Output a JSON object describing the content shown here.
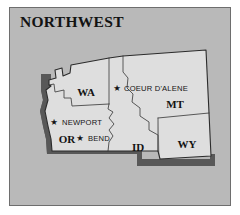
{
  "figure": {
    "title": "NORTHWEST",
    "background_color": "#ffffff",
    "panel_color": "#b9b9b9",
    "panel_border_color": "#6e6e6e",
    "land_fill_color": "#dedede",
    "land_outline_color": "#2b2b2b",
    "state_border_color": "#4a4a4a",
    "shadow_color": "#585858",
    "text_color": "#131313"
  },
  "map": {
    "region_name": "NORTHWEST",
    "states": [
      {
        "abbr": "WA",
        "name_label": "WA",
        "x": 76,
        "y": 84
      },
      {
        "abbr": "MT",
        "name_label": "MT",
        "x": 165,
        "y": 96
      },
      {
        "abbr": "OR",
        "name_label": "OR",
        "x": 57,
        "y": 131
      },
      {
        "abbr": "ID",
        "name_label": "ID",
        "x": 128,
        "y": 139
      },
      {
        "abbr": "WY",
        "name_label": "WY",
        "x": 177,
        "y": 136
      }
    ],
    "cities": [
      {
        "name": "COEUR D'ALENE",
        "state": "ID",
        "marker": "star",
        "star_x": 107,
        "star_y": 80,
        "label_x": 114,
        "label_y": 80
      },
      {
        "name": "NEWPORT",
        "state": "OR",
        "marker": "star",
        "star_x": 44,
        "star_y": 114,
        "label_x": 52,
        "label_y": 114
      },
      {
        "name": "BEND",
        "state": "OR",
        "marker": "star",
        "star_x": 70,
        "star_y": 130,
        "label_x": 78,
        "label_y": 130
      }
    ],
    "marker_glyph": "★"
  }
}
